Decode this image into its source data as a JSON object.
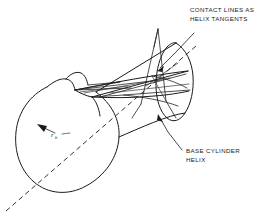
{
  "figure": {
    "background_color": "#ffffff",
    "line_color": "#1a1a1a",
    "width": 261,
    "height": 217
  },
  "annotations": {
    "contact_lines": {
      "line1": "CONTACT LINES AS",
      "line2": "HELIX TANGENTS"
    },
    "base_cylinder": {
      "line1": "BASE CYLINDER",
      "line2": "HELIX"
    },
    "radius": {
      "symbol": "r",
      "subscript": "b"
    }
  },
  "geometry": {
    "front_circle": {
      "center_x": 67,
      "center_y": 135,
      "radius": 53
    },
    "axis": {
      "type": "dash-dot centerline",
      "from_x": 6,
      "from_y": 211,
      "to_x": 196,
      "to_y": 46
    },
    "helix_count": 2,
    "contact_line_count": 6,
    "projection": "oblique"
  }
}
